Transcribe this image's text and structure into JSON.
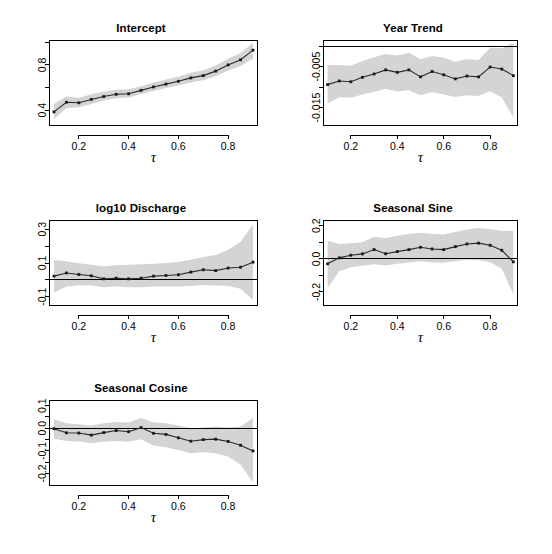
{
  "figure": {
    "background": "#ffffff",
    "band_color": "#d4d4d4",
    "line_color": "#2b2b2b",
    "xlabel": "τ",
    "x_tick_labels": [
      "0.2",
      "0.4",
      "0.6",
      "0.8"
    ],
    "x_tick_values": [
      0.2,
      0.4,
      0.6,
      0.8
    ],
    "xlim": [
      0.08,
      0.92
    ]
  },
  "chart_data": [
    {
      "type": "line",
      "title": "Intercept",
      "xlabel": "τ",
      "ylabel": "",
      "xlim": [
        0.08,
        0.92
      ],
      "ylim": [
        0.26,
        1.02
      ],
      "grid": false,
      "legend": "none",
      "x_ticks": [
        0.2,
        0.4,
        0.6,
        0.8
      ],
      "x_tick_labels": [
        "0.2",
        "0.4",
        "0.6",
        "0.8"
      ],
      "y_ticks": [
        0.4,
        0.8
      ],
      "y_tick_labels": [
        "0.4",
        "0.8"
      ],
      "y_minor_ticks": [
        0.6,
        1.0
      ],
      "reference_line": null,
      "x": [
        0.1,
        0.15,
        0.2,
        0.25,
        0.3,
        0.35,
        0.4,
        0.45,
        0.5,
        0.55,
        0.6,
        0.65,
        0.7,
        0.75,
        0.8,
        0.85,
        0.9
      ],
      "values": [
        0.385,
        0.47,
        0.465,
        0.495,
        0.52,
        0.54,
        0.545,
        0.575,
        0.605,
        0.63,
        0.655,
        0.685,
        0.705,
        0.745,
        0.8,
        0.845,
        0.93
      ],
      "band_lower": [
        0.32,
        0.42,
        0.425,
        0.455,
        0.485,
        0.505,
        0.512,
        0.542,
        0.57,
        0.595,
        0.618,
        0.645,
        0.665,
        0.7,
        0.75,
        0.79,
        0.855
      ],
      "band_upper": [
        0.455,
        0.52,
        0.51,
        0.54,
        0.562,
        0.58,
        0.585,
        0.612,
        0.645,
        0.672,
        0.698,
        0.73,
        0.752,
        0.795,
        0.855,
        0.905,
        0.995
      ]
    },
    {
      "type": "line",
      "title": "Year Trend",
      "xlabel": "τ",
      "ylabel": "",
      "xlim": [
        0.08,
        0.92
      ],
      "ylim": [
        -0.0195,
        0.0015
      ],
      "grid": false,
      "legend": "none",
      "x_ticks": [
        0.2,
        0.4,
        0.6,
        0.8
      ],
      "x_tick_labels": [
        "0.2",
        "0.4",
        "0.6",
        "0.8"
      ],
      "y_ticks": [
        -0.005,
        -0.015
      ],
      "y_tick_labels": [
        "-0.005",
        "-0.015"
      ],
      "y_minor_ticks": [
        0.0,
        -0.01
      ],
      "reference_line": 0.0,
      "x": [
        0.1,
        0.15,
        0.2,
        0.25,
        0.3,
        0.35,
        0.4,
        0.45,
        0.5,
        0.55,
        0.6,
        0.65,
        0.7,
        0.75,
        0.8,
        0.85,
        0.9
      ],
      "values": [
        -0.0094,
        -0.0085,
        -0.0087,
        -0.0076,
        -0.0068,
        -0.0058,
        -0.0064,
        -0.0058,
        -0.0075,
        -0.0062,
        -0.007,
        -0.008,
        -0.0073,
        -0.0075,
        -0.0051,
        -0.0056,
        -0.0072
      ],
      "band_lower": [
        -0.014,
        -0.0125,
        -0.0126,
        -0.0118,
        -0.0112,
        -0.0104,
        -0.0111,
        -0.0108,
        -0.012,
        -0.0112,
        -0.0118,
        -0.0124,
        -0.012,
        -0.0122,
        -0.011,
        -0.0125,
        -0.0175
      ],
      "band_upper": [
        -0.0046,
        -0.0046,
        -0.0048,
        -0.0036,
        -0.0027,
        -0.0019,
        -0.0023,
        -0.0016,
        -0.0032,
        -0.0024,
        -0.0028,
        -0.0038,
        -0.0032,
        -0.0034,
        -0.0004,
        -0.0005,
        0.0008
      ]
    },
    {
      "type": "line",
      "title": "log10 Discharge",
      "xlabel": "τ",
      "ylabel": "",
      "xlim": [
        0.08,
        0.92
      ],
      "ylim": [
        -0.155,
        0.355
      ],
      "grid": false,
      "legend": "none",
      "x_ticks": [
        0.2,
        0.4,
        0.6,
        0.8
      ],
      "x_tick_labels": [
        "0.2",
        "0.4",
        "0.6",
        "0.8"
      ],
      "y_ticks": [
        0.3,
        0.1,
        -0.1
      ],
      "y_tick_labels": [
        "0.3",
        "0.1",
        "-0.1"
      ],
      "y_minor_ticks": [
        0.2,
        0.0
      ],
      "reference_line": 0.0,
      "x": [
        0.1,
        0.15,
        0.2,
        0.25,
        0.3,
        0.35,
        0.4,
        0.45,
        0.5,
        0.55,
        0.6,
        0.65,
        0.7,
        0.75,
        0.8,
        0.85,
        0.9
      ],
      "values": [
        0.022,
        0.041,
        0.032,
        0.024,
        0.006,
        0.01,
        0.006,
        0.01,
        0.022,
        0.026,
        0.03,
        0.046,
        0.06,
        0.055,
        0.07,
        0.075,
        0.105
      ],
      "band_lower": [
        -0.076,
        -0.04,
        -0.032,
        -0.034,
        -0.044,
        -0.04,
        -0.044,
        -0.044,
        -0.04,
        -0.04,
        -0.04,
        -0.036,
        -0.03,
        -0.034,
        -0.036,
        -0.052,
        -0.12
      ],
      "band_upper": [
        0.118,
        0.11,
        0.098,
        0.09,
        0.08,
        0.086,
        0.09,
        0.092,
        0.096,
        0.1,
        0.106,
        0.12,
        0.136,
        0.148,
        0.178,
        0.225,
        0.33
      ]
    },
    {
      "type": "line",
      "title": "Seasonal Sine",
      "xlabel": "τ",
      "ylabel": "",
      "xlim": [
        0.08,
        0.92
      ],
      "ylim": [
        -0.285,
        0.235
      ],
      "grid": false,
      "legend": "none",
      "x_ticks": [
        0.2,
        0.4,
        0.6,
        0.8
      ],
      "x_tick_labels": [
        "0.2",
        "0.4",
        "0.6",
        "0.8"
      ],
      "y_ticks": [
        0.2,
        0.0,
        -0.2
      ],
      "y_tick_labels": [
        "0.2",
        "0.0",
        "-0.2"
      ],
      "y_minor_ticks": [
        0.1,
        -0.1
      ],
      "reference_line": 0.0,
      "x": [
        0.1,
        0.15,
        0.2,
        0.25,
        0.3,
        0.35,
        0.4,
        0.45,
        0.5,
        0.55,
        0.6,
        0.65,
        0.7,
        0.75,
        0.8,
        0.85,
        0.9
      ],
      "values": [
        -0.03,
        0.006,
        0.022,
        0.03,
        0.056,
        0.031,
        0.044,
        0.056,
        0.07,
        0.06,
        0.056,
        0.074,
        0.09,
        0.095,
        0.082,
        0.052,
        -0.018
      ],
      "band_lower": [
        -0.175,
        -0.075,
        -0.05,
        -0.042,
        -0.032,
        -0.04,
        -0.03,
        -0.022,
        -0.014,
        -0.022,
        -0.024,
        -0.014,
        -0.006,
        -0.008,
        -0.02,
        -0.06,
        -0.215
      ],
      "band_upper": [
        0.11,
        0.09,
        0.094,
        0.1,
        0.134,
        0.126,
        0.14,
        0.15,
        0.158,
        0.15,
        0.148,
        0.162,
        0.178,
        0.186,
        0.18,
        0.168,
        0.17
      ]
    },
    {
      "type": "line",
      "title": "Seasonal Cosine",
      "xlabel": "τ",
      "ylabel": "",
      "xlim": [
        0.08,
        0.92
      ],
      "ylim": [
        -0.255,
        0.125
      ],
      "grid": false,
      "legend": "none",
      "x_ticks": [
        0.2,
        0.4,
        0.6,
        0.8
      ],
      "x_tick_labels": [
        "0.2",
        "0.4",
        "0.6",
        "0.8"
      ],
      "y_ticks": [
        0.1,
        0.0,
        -0.1,
        -0.2
      ],
      "y_tick_labels": [
        "0.1",
        "0.0",
        "-0.1",
        "-0.2"
      ],
      "y_minor_ticks": [
        0.05,
        -0.05,
        -0.15
      ],
      "reference_line": 0.0,
      "x": [
        0.1,
        0.15,
        0.2,
        0.25,
        0.3,
        0.35,
        0.4,
        0.45,
        0.5,
        0.55,
        0.6,
        0.65,
        0.7,
        0.75,
        0.8,
        0.85,
        0.9
      ],
      "values": [
        -0.002,
        -0.02,
        -0.021,
        -0.03,
        -0.019,
        -0.01,
        -0.015,
        0.003,
        -0.022,
        -0.027,
        -0.042,
        -0.057,
        -0.05,
        -0.048,
        -0.058,
        -0.075,
        -0.1
      ],
      "band_lower": [
        -0.046,
        -0.056,
        -0.058,
        -0.066,
        -0.06,
        -0.056,
        -0.06,
        -0.048,
        -0.076,
        -0.084,
        -0.096,
        -0.11,
        -0.106,
        -0.11,
        -0.126,
        -0.16,
        -0.24
      ],
      "band_upper": [
        0.04,
        0.022,
        0.018,
        0.012,
        0.022,
        0.028,
        0.026,
        0.046,
        0.026,
        0.022,
        0.012,
        0.0,
        0.004,
        0.008,
        0.004,
        0.008,
        0.045
      ]
    }
  ]
}
